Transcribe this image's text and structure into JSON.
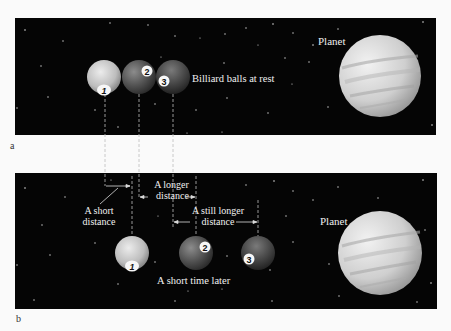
{
  "panels": [
    {
      "letter": "a",
      "caption": "Billiard balls at rest",
      "planet_label": "Planet",
      "balls": [
        {
          "number": "1",
          "cx": 104,
          "cy": 77
        },
        {
          "number": "2",
          "cx": 139,
          "cy": 77
        },
        {
          "number": "3",
          "cx": 173,
          "cy": 77
        }
      ]
    },
    {
      "letter": "b",
      "caption": "A short time later",
      "planet_label": "Planet",
      "balls": [
        {
          "number": "1",
          "cx": 132,
          "cy": 253
        },
        {
          "number": "2",
          "cx": 196,
          "cy": 253
        },
        {
          "number": "3",
          "cx": 258,
          "cy": 253
        }
      ],
      "distances": [
        {
          "label_line1": "A short",
          "label_line2": "distance"
        },
        {
          "label_line1": "A longer",
          "label_line2": "distance"
        },
        {
          "label_line1": "A still longer",
          "label_line2": "distance"
        }
      ]
    }
  ],
  "colors": {
    "space": "#050505",
    "background": "#fafafa",
    "text_light": "#f0f0f0",
    "ball1": "#c8c8c8",
    "ball2": "#5a5a5a",
    "ball3": "#4a4a4a",
    "planet": "#d6d6d6"
  }
}
